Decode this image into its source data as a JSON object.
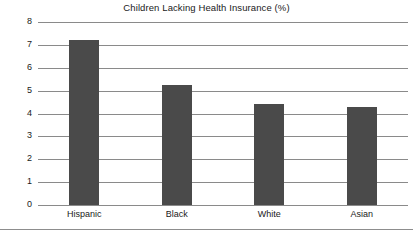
{
  "chart_data": {
    "type": "bar",
    "title": "Children Lacking Health Insurance (%)",
    "xlabel": "",
    "ylabel": "",
    "categories": [
      "Hispanic",
      "Black",
      "White",
      "Asian"
    ],
    "values": [
      7.2,
      5.25,
      4.4,
      4.3
    ],
    "ylim": [
      0,
      8
    ],
    "yticks": [
      0,
      1,
      2,
      3,
      4,
      5,
      6,
      7,
      8
    ],
    "ytick_labels": [
      "0",
      "1",
      "2",
      "3",
      "4",
      "5",
      "6",
      "7",
      "8"
    ],
    "grid": true,
    "grid_axis": "y",
    "legend": false,
    "legend_position": "none",
    "series": [
      {
        "name": "Children Lacking Health Insurance (%)",
        "values": [
          7.2,
          5.25,
          4.4,
          4.3
        ]
      }
    ]
  },
  "style": {
    "bar_color": "#4a4a4a",
    "grid_color": "#8a8a8a",
    "frame_color": "#8d8d8d",
    "text_color": "#1a1a1a",
    "background": "#ffffff"
  }
}
